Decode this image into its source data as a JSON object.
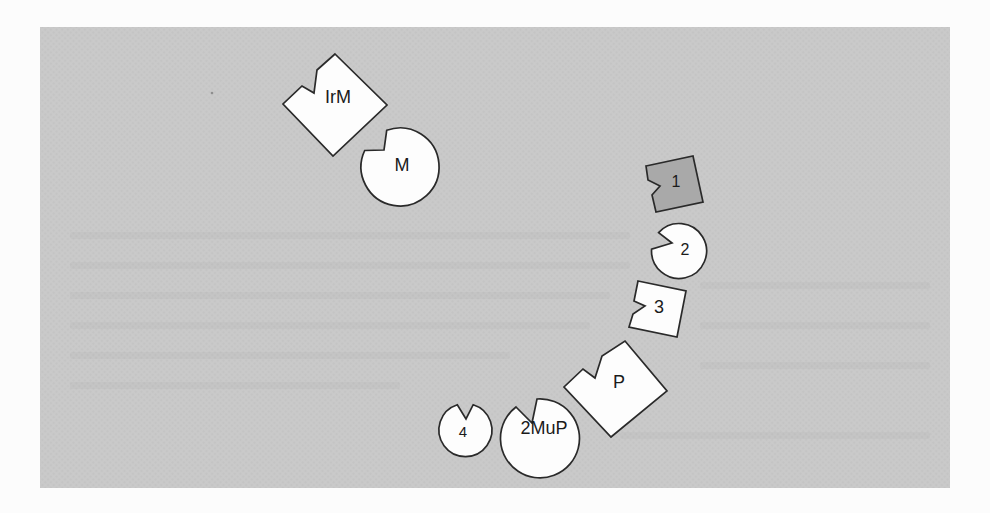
{
  "figure": {
    "shapes": {
      "irm": {
        "label": "IrM",
        "kind": "notched-diamond"
      },
      "m": {
        "label": "M",
        "kind": "notched-circle"
      },
      "s1": {
        "label": "1",
        "kind": "notched-square-dark"
      },
      "c2": {
        "label": "2",
        "kind": "notched-circle"
      },
      "s3": {
        "label": "3",
        "kind": "notched-square"
      },
      "p": {
        "label": "P",
        "kind": "notched-diamond"
      },
      "c4": {
        "label": "4",
        "kind": "notched-circle"
      },
      "mup": {
        "label": "2MuP",
        "kind": "notched-circle"
      }
    },
    "colors": {
      "page": "#fcfcfc",
      "panel": "#c9c9c9",
      "shape_fill": "#fdfdfd",
      "shape_dark_fill": "#a9a9a9",
      "stroke": "#2a2a2a",
      "label_text": "#1b1b1b"
    }
  }
}
